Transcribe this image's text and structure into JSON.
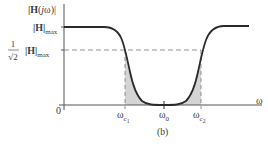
{
  "figure": {
    "caption": "(b)",
    "y_axis_label": "|H(jω)|",
    "y_levels": [
      {
        "name": "max",
        "label_main": "|H|",
        "label_sub": "max"
      },
      {
        "name": "cutoff",
        "label_frac_num": "1",
        "label_frac_den": "√2",
        "label_main": "|H|",
        "label_sub": "max"
      }
    ],
    "x_axis_label": "ω",
    "origin_label": "0",
    "x_ticks": [
      {
        "name": "wc1",
        "main": "ω",
        "sub": "c",
        "subsub": "1"
      },
      {
        "name": "w0",
        "main": "ω",
        "sub": "0"
      },
      {
        "name": "wc2",
        "main": "ω",
        "sub": "c",
        "subsub": "2"
      }
    ],
    "curve_description": "Band-stop (notch) filter magnitude response; shaded stop-band region between ωc1 and ωc2 below curve",
    "colors": {
      "curve": "#2a2a2a",
      "axis": "#555555",
      "dashed": "#777777",
      "shade": "#d4d4d4"
    }
  }
}
